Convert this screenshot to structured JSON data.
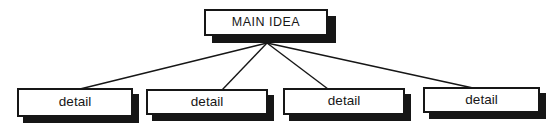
{
  "diagram": {
    "type": "idea-map",
    "root": {
      "label": "MAIN IDEA"
    },
    "children": [
      {
        "label": "detail"
      },
      {
        "label": "detail"
      },
      {
        "label": "detail"
      },
      {
        "label": "detail"
      }
    ],
    "colors": {
      "background": "#ffffff",
      "box_fill": "#ffffff",
      "box_border": "#161616",
      "shadow": "#161616",
      "connector_line": "#161616",
      "text": "#161616"
    }
  }
}
